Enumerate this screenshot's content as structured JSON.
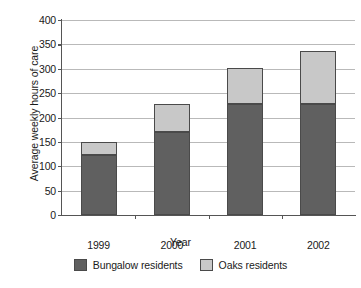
{
  "chart_data": {
    "type": "bar",
    "subtype": "stacked-vertical-bar",
    "title": "",
    "xlabel": "Year",
    "ylabel": "Average weekly hours of care",
    "categories": [
      "1999",
      "2000",
      "2001",
      "2002"
    ],
    "series": [
      {
        "name": "Bungalow residents",
        "color": "#606060",
        "values": [
          123,
          170,
          227,
          228
        ]
      },
      {
        "name": "Oaks residents",
        "color": "#c8c8c8",
        "values": [
          27,
          58,
          75,
          109
        ]
      }
    ],
    "totals": [
      150,
      228,
      302,
      337
    ],
    "ylim": [
      0,
      400
    ],
    "ytick_step": 50,
    "yticks": [
      "0",
      "50",
      "100",
      "150",
      "200",
      "250",
      "300",
      "350",
      "400"
    ],
    "grid": "horizontal",
    "legend_position": "bottom-center"
  },
  "legend": {
    "items": [
      {
        "label": "Bungalow residents",
        "swatch": "#606060"
      },
      {
        "label": "Oaks residents",
        "swatch": "#c8c8c8"
      }
    ]
  },
  "axes": {
    "x_title": "Year",
    "y_title": "Average weekly hours of care"
  }
}
